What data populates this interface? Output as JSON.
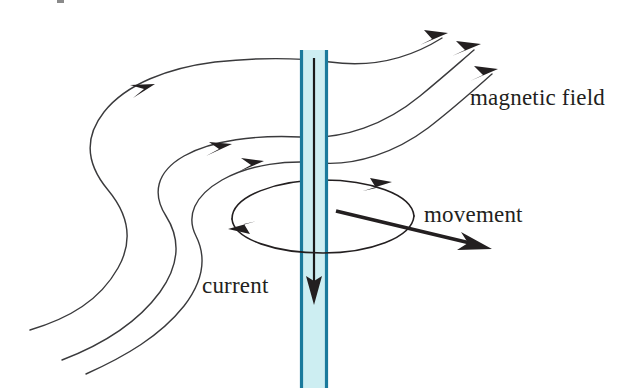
{
  "diagram": {
    "labels": {
      "magnetic_field": "magnetic field",
      "movement": "movement",
      "current": "current"
    },
    "colors": {
      "wire_edge": "#1a7a9c",
      "wire_fill": "#cdeef2",
      "field_line": "#3a3a3c",
      "arrow": "#231f20",
      "text": "#231f20",
      "background": "#ffffff"
    },
    "elements": {
      "conductor_name": "vertical-conductor",
      "current_direction": "downward",
      "field_line_count": 4,
      "field_arrow_count": 6,
      "loop_arrow_count": 2,
      "movement_direction": "down-right"
    }
  }
}
